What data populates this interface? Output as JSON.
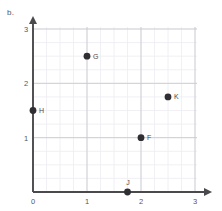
{
  "panel": {
    "label": "b."
  },
  "chart_data": {
    "type": "scatter",
    "title": "",
    "xlabel": "",
    "ylabel": "",
    "xlim": [
      0,
      3
    ],
    "ylim": [
      0,
      3
    ],
    "xticks": [
      0,
      1,
      2,
      3
    ],
    "yticks": [
      0,
      1,
      2,
      3
    ],
    "xtick_labels": [
      "0",
      "1",
      "2",
      "3"
    ],
    "ytick_labels": [
      "0",
      "1",
      "2",
      "3"
    ],
    "grid": true,
    "grid_major_step": 1,
    "grid_minor_step": 0.25,
    "legend": "none",
    "axis_arrows": true,
    "points": [
      {
        "label": "G",
        "x": 1,
        "y": 2.5
      },
      {
        "label": "K",
        "x": 2.5,
        "y": 1.75
      },
      {
        "label": "H",
        "x": 0,
        "y": 1.5
      },
      {
        "label": "F",
        "x": 2,
        "y": 1
      },
      {
        "label": "J",
        "x": 1.75,
        "y": 0
      }
    ]
  },
  "colors": {
    "point": "#2f2f33",
    "axis": "#4a4a4d",
    "grid_major": "#c9c9d2",
    "grid_minor": "#ececf2",
    "text": "#55555a",
    "background": "#ffffff"
  }
}
